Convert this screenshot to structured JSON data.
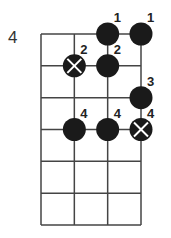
{
  "diagram": {
    "type": "chord-fretboard",
    "start_fret_label": "4",
    "num_strings": 4,
    "num_fret_lines": 7,
    "colors": {
      "grid": "#444444",
      "dot": "#1a1a1a",
      "mark": "#ffffff",
      "text": "#222222"
    },
    "notes": [
      {
        "string": 3,
        "line": 0,
        "finger": "1",
        "muted": false
      },
      {
        "string": 4,
        "line": 0,
        "finger": "1",
        "muted": false
      },
      {
        "string": 2,
        "line": 1,
        "finger": "2",
        "muted": true
      },
      {
        "string": 3,
        "line": 1,
        "finger": "2",
        "muted": false
      },
      {
        "string": 4,
        "line": 2,
        "finger": "3",
        "muted": false
      },
      {
        "string": 2,
        "line": 3,
        "finger": "4",
        "muted": false
      },
      {
        "string": 3,
        "line": 3,
        "finger": "4",
        "muted": false
      },
      {
        "string": 4,
        "line": 3,
        "finger": "4",
        "muted": true
      }
    ]
  }
}
